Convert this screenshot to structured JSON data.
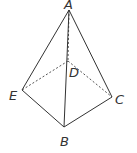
{
  "diagram": {
    "type": "pyramid",
    "points": {
      "A": {
        "label": "A",
        "x": 69,
        "y": 10,
        "lx": 64,
        "ly": 9
      },
      "D": {
        "label": "D",
        "x": 68,
        "y": 61,
        "lx": 69,
        "ly": 77
      },
      "E": {
        "label": "E",
        "x": 22,
        "y": 90,
        "lx": 9,
        "ly": 100
      },
      "C": {
        "label": "C",
        "x": 112,
        "y": 97,
        "lx": 115,
        "ly": 104
      },
      "B": {
        "label": "B",
        "x": 64,
        "y": 127,
        "lx": 60,
        "ly": 146
      }
    },
    "solid_edges": [
      [
        "A",
        "E"
      ],
      [
        "A",
        "C"
      ],
      [
        "A",
        "B"
      ],
      [
        "E",
        "B"
      ],
      [
        "B",
        "C"
      ]
    ],
    "dashed_edges": [
      [
        "A",
        "D"
      ],
      [
        "D",
        "E"
      ],
      [
        "D",
        "C"
      ]
    ]
  }
}
